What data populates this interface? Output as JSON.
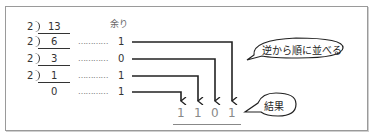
{
  "diagram": {
    "top_cutoff_text": "・・・・・",
    "remainder_label": "余り",
    "divisor": "2",
    "steps": [
      {
        "quotient_input": "13",
        "remainder": ""
      },
      {
        "quotient_input": "6",
        "remainder": "1"
      },
      {
        "quotient_input": "3",
        "remainder": "0"
      },
      {
        "quotient_input": "1",
        "remainder": "1"
      },
      {
        "quotient_input": "0",
        "remainder": "1"
      }
    ],
    "dots": "…………",
    "result_digits": [
      "1",
      "1",
      "0",
      "1"
    ],
    "callouts": {
      "reverse_order": "逆から順に並べる",
      "result": "結果"
    },
    "colors": {
      "line": "#222222",
      "result_text": "#888888",
      "frame": "#9a9a9a"
    }
  }
}
